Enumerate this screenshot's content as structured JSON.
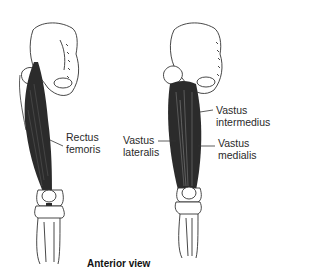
{
  "labels": {
    "rectus_femoris": [
      "Rectus",
      "femoris"
    ],
    "vastus_intermedius": [
      "Vastus",
      "intermedius"
    ],
    "vastus_lateralis": [
      "Vastus",
      "lateralis"
    ],
    "vastus_medialis": [
      "Vastus",
      "medialis"
    ]
  },
  "caption": "Anterior view",
  "colors": {
    "muscle": "#2b2b2b",
    "bone_outline": "#333333",
    "bone_fill": "#ffffff",
    "text": "#2a2a2a"
  }
}
